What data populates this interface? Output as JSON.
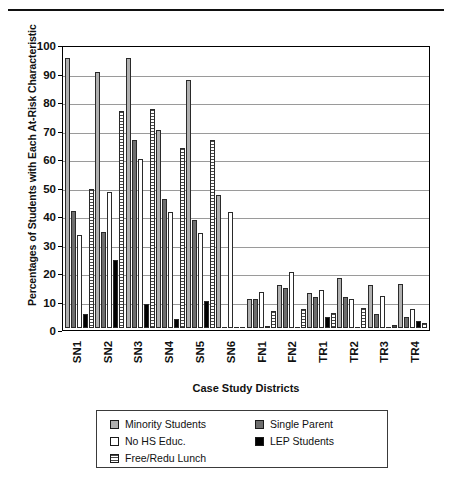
{
  "chart_data": {
    "type": "bar",
    "title": "",
    "xlabel": "Case Study Districts",
    "ylabel": "Percentages of Students with Each At-Risk Characteristic",
    "ylim": [
      0,
      100
    ],
    "yticks": [
      0,
      10,
      20,
      30,
      40,
      50,
      60,
      70,
      80,
      90,
      100
    ],
    "grid": true,
    "legend_position": "bottom",
    "categories": [
      "SN1",
      "SN2",
      "SN3",
      "SN4",
      "SN5",
      "SN6",
      "FN1",
      "FN2",
      "TR1",
      "TR2",
      "TR3",
      "TR4"
    ],
    "series": [
      {
        "name": "Minority Students",
        "color": "#b0b0b0",
        "values": [
          96,
          91,
          96,
          70.5,
          88,
          47.5,
          10.3,
          15.4,
          12.5,
          18,
          15.3,
          15.7
        ]
      },
      {
        "name": "Single Parent",
        "color": "#6e6e6e",
        "values": [
          41.8,
          34.3,
          67,
          46,
          38.5,
          0,
          10.5,
          14.3,
          11,
          11.2,
          5,
          4
        ]
      },
      {
        "name": "No HS Educ.",
        "color": "#ffffff",
        "values": [
          33.2,
          48.5,
          60,
          41.3,
          33.8,
          41.3,
          13,
          20,
          13.7,
          10.5,
          11.6,
          7
        ]
      },
      {
        "name": "LEP Students",
        "color": "#000000",
        "values": [
          5,
          24.2,
          8.5,
          3.3,
          9.8,
          0,
          1,
          0,
          4,
          0,
          0,
          2.5
        ]
      },
      {
        "name": "Free/Redu Lunch",
        "color": "#ffffff-hatch",
        "values": [
          49.4,
          77,
          77.8,
          64,
          67,
          0,
          6.3,
          7,
          5.3,
          7.2,
          1.2,
          2
        ]
      }
    ],
    "series_draw_order": [
      0,
      1,
      2,
      3,
      4
    ]
  },
  "legend": {
    "left_column": [
      {
        "label": "Minority Students",
        "swatch": "s0"
      },
      {
        "label": "No HS Educ.",
        "swatch": "s2"
      },
      {
        "label": "Free/Redu Lunch",
        "swatch": "s4"
      }
    ],
    "right_column": [
      {
        "label": "Single Parent",
        "swatch": "s1"
      },
      {
        "label": "LEP Students",
        "swatch": "s3"
      }
    ]
  }
}
